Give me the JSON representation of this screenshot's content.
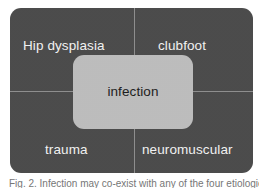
{
  "figure": {
    "type": "quadrant-diagram",
    "panel_color": "#4b4b4b",
    "center_color": "#bdbdbd",
    "label_color": "#f2f2f2",
    "center_label_color": "#1c1c1c",
    "divider_color": "#8e8e8e",
    "background_color": "#ffffff",
    "quadrants": [
      {
        "position": "top-left",
        "label": "Hip dysplasia"
      },
      {
        "position": "top-right",
        "label": "clubfoot"
      },
      {
        "position": "bottom-left",
        "label": "trauma"
      },
      {
        "position": "bottom-right",
        "label": "neuromuscular"
      }
    ],
    "center": {
      "label": "infection"
    },
    "caption": "Fig. 2. Infection may co-exist with any of the four etiologies."
  }
}
